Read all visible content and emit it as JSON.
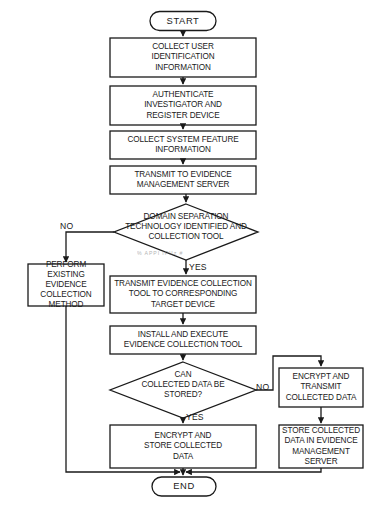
{
  "diagram": {
    "type": "flowchart",
    "stroke_color": "#1a1a1a",
    "background_color": "#ffffff",
    "nodes": [
      {
        "id": "start",
        "shape": "terminal",
        "label": "START"
      },
      {
        "id": "collect_user",
        "shape": "process",
        "label": "COLLECT USER\nIDENTIFICATION\nINFORMATION"
      },
      {
        "id": "authenticate",
        "shape": "process",
        "label": "AUTHENTICATE\nINVESTIGATOR AND\nREGISTER DEVICE"
      },
      {
        "id": "sys_feature",
        "shape": "process",
        "label": "COLLECT SYSTEM FEATURE\nINFORMATION"
      },
      {
        "id": "transmit_ems",
        "shape": "process",
        "label": "TRANSMIT TO EVIDENCE\nMANAGEMENT SERVER"
      },
      {
        "id": "domain_sep",
        "shape": "decision",
        "label": "DOMAIN SEPARATION\nTECHNOLOGY IDENTIFIED AND\nCOLLECTION TOOL"
      },
      {
        "id": "perform_existing",
        "shape": "process",
        "label": "PERFORM\nEXISTING EVIDENCE\nCOLLECTION\nMETHOD"
      },
      {
        "id": "transmit_tool",
        "shape": "process",
        "label": "TRANSMIT EVIDENCE COLLECTION\nTOOL TO CORRESPONDING\nTARGET DEVICE"
      },
      {
        "id": "install_exec",
        "shape": "process",
        "label": "INSTALL AND EXECUTE\nEVIDENCE COLLECTION TOOL"
      },
      {
        "id": "can_store",
        "shape": "decision",
        "label": "CAN\nCOLLECTED DATA BE\nSTORED?"
      },
      {
        "id": "encrypt_transmit",
        "shape": "process",
        "label": "ENCRYPT AND\nTRANSMIT\nCOLLECTED DATA"
      },
      {
        "id": "encrypt_store",
        "shape": "process",
        "label": "ENCRYPT AND\nSTORE COLLECTED\nDATA"
      },
      {
        "id": "store_in_ems",
        "shape": "process",
        "label": "STORE COLLECTED\nDATA IN EVIDENCE\nMANAGEMENT\nSERVER"
      },
      {
        "id": "end",
        "shape": "terminal",
        "label": "END"
      }
    ],
    "edge_labels": {
      "domain_no": "NO",
      "domain_yes": "YES",
      "store_no": "NO",
      "store_yes": "YES"
    },
    "artifacts": {
      "smudge_text": "%  ΑΡΡΙ ΙΡΙΙⱬ  #"
    }
  }
}
